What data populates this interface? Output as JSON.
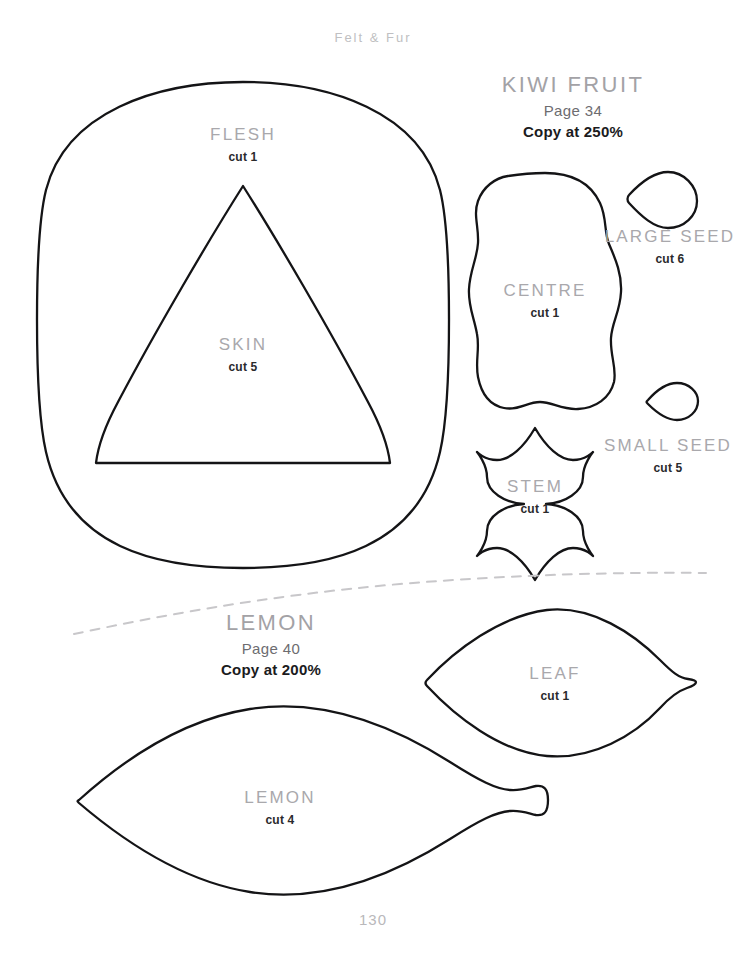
{
  "page": {
    "running_head": "Felt & Fur",
    "folio": "130"
  },
  "patterns": [
    {
      "name": "KIWI FRUIT",
      "page_ref": "Page 34",
      "copy_at": "Copy at 250%"
    },
    {
      "name": "LEMON",
      "page_ref": "Page 40",
      "copy_at": "Copy at 200%"
    }
  ],
  "pieces": [
    {
      "name": "FLESH",
      "cut": "cut 1"
    },
    {
      "name": "SKIN",
      "cut": "cut 5"
    },
    {
      "name": "CENTRE",
      "cut": "cut 1"
    },
    {
      "name": "LARGE SEED",
      "cut": "cut 6"
    },
    {
      "name": "SMALL SEED",
      "cut": "cut 5"
    },
    {
      "name": "STEM",
      "cut": "cut 1"
    },
    {
      "name": "LEAF",
      "cut": "cut 1"
    },
    {
      "name": "LEMON",
      "cut": "cut 4"
    }
  ],
  "colors": {
    "outline": "#141416",
    "piece_name": "#a9a8ac",
    "cut_text": "#2a2a2c",
    "title_name": "#a3a2a6",
    "page_ref": "#6d6c70",
    "copy_at": "#1b1b1d",
    "running_head": "#c0bfc2",
    "folio": "#b9b8bb",
    "divider": "#c8c7ca",
    "background": "#ffffff"
  }
}
